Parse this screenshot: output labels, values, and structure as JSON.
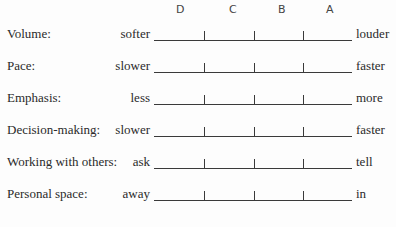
{
  "scale_headers": [
    "D",
    "C",
    "B",
    "A"
  ],
  "rows": [
    {
      "label": "Volume:",
      "left": "softer",
      "right": "louder"
    },
    {
      "label": "Pace:",
      "left": "slower",
      "right": "faster"
    },
    {
      "label": "Emphasis:",
      "left": "less",
      "right": "more"
    },
    {
      "label": "Decision-making:",
      "left": "slower",
      "right": "faster"
    },
    {
      "label": "Working with others:",
      "left": "ask",
      "right": "tell"
    },
    {
      "label": "Personal space:",
      "left": "away",
      "right": "in"
    }
  ]
}
